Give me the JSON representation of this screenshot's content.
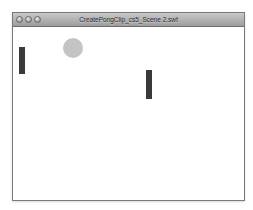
{
  "window": {
    "title": "CreatePongClip_cs5_Scene 2.swf",
    "controls": [
      "close-button",
      "minimize-button",
      "zoom-button"
    ]
  },
  "stage": {
    "background": "#ffffff",
    "left_paddle": {
      "x": 6,
      "y": 20,
      "width": 6,
      "height": 27,
      "color": "#3a3a3a"
    },
    "right_paddle": {
      "x": 133,
      "y": 43,
      "width": 6,
      "height": 29,
      "color": "#3a3a3a"
    },
    "ball": {
      "cx": 60,
      "cy": 21,
      "radius": 10,
      "color": "#c4c4c4"
    }
  }
}
